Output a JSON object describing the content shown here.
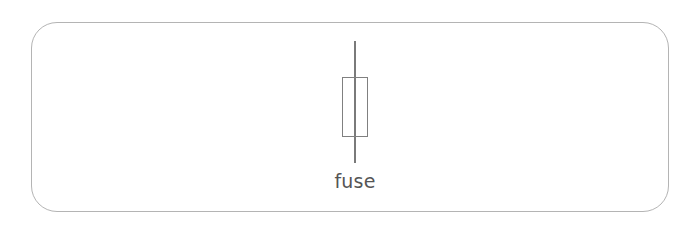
{
  "figure": {
    "background_color": "#ffffff",
    "frame": {
      "name": "rounded-panel-border",
      "stroke_color": "#b4b4b4",
      "corner_radius": "26px"
    },
    "symbol": {
      "kind": "fuse-schematic-symbol",
      "caption": "fuse",
      "stroke_color": "#7a7a7a",
      "body_stroke_color": "#808080",
      "parts": {
        "lead_line": "vertical-lead-line",
        "body": "rectangular-fuse-body"
      }
    },
    "caption_color": "#555555"
  }
}
